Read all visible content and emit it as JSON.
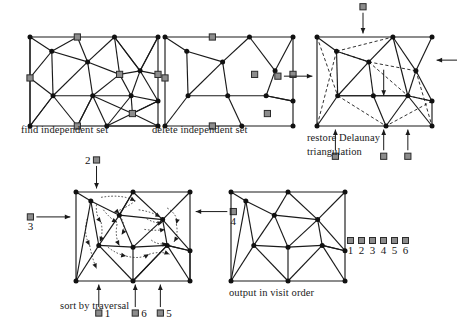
{
  "figure": {
    "background_color": "#ffffff",
    "node_color": "#111111",
    "marked_node_color": "#8c8c8c",
    "marked_node_border": "#2b2b2b",
    "edge_color": "#1a1a1a",
    "dashed_edge_color": "#1a1a1a",
    "arrow_color": "#1a1a1a"
  },
  "panels": [
    {
      "id": "find-independent-set",
      "caption": "find independent set",
      "box": [
        24,
        31,
        128,
        89
      ],
      "nodes": [
        {
          "x": 0.0,
          "y": 0.0,
          "marked": false
        },
        {
          "x": 0.37,
          "y": 0.0,
          "marked": true
        },
        {
          "x": 0.66,
          "y": 0.0,
          "marked": false
        },
        {
          "x": 1.0,
          "y": 0.0,
          "marked": false
        },
        {
          "x": 0.17,
          "y": 0.16,
          "marked": false
        },
        {
          "x": 0.45,
          "y": 0.28,
          "marked": false
        },
        {
          "x": 0.0,
          "y": 0.46,
          "marked": true
        },
        {
          "x": 0.7,
          "y": 0.42,
          "marked": true
        },
        {
          "x": 0.86,
          "y": 0.38,
          "marked": false
        },
        {
          "x": 1.0,
          "y": 0.42,
          "marked": true
        },
        {
          "x": 0.18,
          "y": 0.66,
          "marked": false
        },
        {
          "x": 0.49,
          "y": 0.66,
          "marked": false
        },
        {
          "x": 0.79,
          "y": 0.66,
          "marked": false
        },
        {
          "x": 1.0,
          "y": 0.72,
          "marked": false
        },
        {
          "x": 0.8,
          "y": 0.86,
          "marked": true
        },
        {
          "x": 0.0,
          "y": 1.0,
          "marked": false
        },
        {
          "x": 0.37,
          "y": 1.0,
          "marked": true
        },
        {
          "x": 0.6,
          "y": 1.0,
          "marked": false
        },
        {
          "x": 1.0,
          "y": 1.0,
          "marked": false
        }
      ],
      "edges": [
        [
          0,
          1
        ],
        [
          1,
          2
        ],
        [
          2,
          3
        ],
        [
          0,
          6
        ],
        [
          6,
          15
        ],
        [
          15,
          16
        ],
        [
          16,
          17
        ],
        [
          17,
          18
        ],
        [
          3,
          9
        ],
        [
          9,
          13
        ],
        [
          13,
          18
        ],
        [
          0,
          4
        ],
        [
          1,
          4
        ],
        [
          4,
          5
        ],
        [
          1,
          5
        ],
        [
          2,
          5
        ],
        [
          2,
          7
        ],
        [
          5,
          7
        ],
        [
          4,
          6
        ],
        [
          6,
          10
        ],
        [
          4,
          10
        ],
        [
          5,
          10
        ],
        [
          5,
          11
        ],
        [
          10,
          11
        ],
        [
          11,
          7
        ],
        [
          7,
          8
        ],
        [
          8,
          2
        ],
        [
          2,
          8
        ],
        [
          8,
          3
        ],
        [
          3,
          8
        ],
        [
          8,
          9
        ],
        [
          7,
          12
        ],
        [
          12,
          8
        ],
        [
          8,
          13
        ],
        [
          12,
          13
        ],
        [
          11,
          12
        ],
        [
          10,
          16
        ],
        [
          11,
          16
        ],
        [
          16,
          11
        ],
        [
          11,
          17
        ],
        [
          12,
          17
        ],
        [
          12,
          14
        ],
        [
          14,
          17
        ],
        [
          14,
          13
        ],
        [
          14,
          18
        ],
        [
          17,
          18
        ],
        [
          13,
          14
        ],
        [
          15,
          10
        ],
        [
          0,
          15
        ],
        [
          10,
          15
        ],
        [
          11,
          14
        ]
      ],
      "dashed_edges": [],
      "arrows": []
    },
    {
      "id": "delete-independent-set",
      "caption": "delete independent set",
      "box": [
        159,
        31,
        128,
        89
      ],
      "nodes": [
        {
          "x": 0.0,
          "y": 0.0,
          "marked": false
        },
        {
          "x": 0.37,
          "y": 0.0,
          "marked": true
        },
        {
          "x": 0.66,
          "y": 0.0,
          "marked": false
        },
        {
          "x": 1.0,
          "y": 0.0,
          "marked": false
        },
        {
          "x": 0.17,
          "y": 0.16,
          "marked": false
        },
        {
          "x": 0.45,
          "y": 0.28,
          "marked": false
        },
        {
          "x": 0.0,
          "y": 0.46,
          "marked": true
        },
        {
          "x": 0.7,
          "y": 0.42,
          "marked": true
        },
        {
          "x": 0.86,
          "y": 0.38,
          "marked": false
        },
        {
          "x": 1.0,
          "y": 0.42,
          "marked": true
        },
        {
          "x": 0.18,
          "y": 0.66,
          "marked": false
        },
        {
          "x": 0.49,
          "y": 0.66,
          "marked": false
        },
        {
          "x": 0.79,
          "y": 0.66,
          "marked": false
        },
        {
          "x": 1.0,
          "y": 0.72,
          "marked": false
        },
        {
          "x": 0.8,
          "y": 0.86,
          "marked": true
        },
        {
          "x": 0.0,
          "y": 1.0,
          "marked": false
        },
        {
          "x": 0.37,
          "y": 1.0,
          "marked": true
        },
        {
          "x": 0.6,
          "y": 1.0,
          "marked": false
        },
        {
          "x": 1.0,
          "y": 1.0,
          "marked": false
        }
      ],
      "edges": [
        [
          0,
          1
        ],
        [
          1,
          2
        ],
        [
          2,
          3
        ],
        [
          0,
          6
        ],
        [
          6,
          15
        ],
        [
          15,
          16
        ],
        [
          16,
          17
        ],
        [
          17,
          18
        ],
        [
          3,
          9
        ],
        [
          9,
          13
        ],
        [
          13,
          18
        ],
        [
          0,
          4
        ],
        [
          4,
          5
        ],
        [
          2,
          5
        ],
        [
          4,
          10
        ],
        [
          5,
          10
        ],
        [
          5,
          11
        ],
        [
          10,
          11
        ],
        [
          2,
          8
        ],
        [
          8,
          3
        ],
        [
          8,
          12
        ],
        [
          11,
          12
        ],
        [
          12,
          13
        ],
        [
          10,
          15
        ],
        [
          11,
          17
        ],
        [
          12,
          13
        ]
      ],
      "dashed_edges": [],
      "arrows": []
    },
    {
      "id": "restore-delaunay-triangulation",
      "caption": "restore Delaunay triangulation",
      "box": [
        311,
        31,
        115,
        89
      ],
      "nodes": [
        {
          "x": 0.0,
          "y": 0.0,
          "marked": false
        },
        {
          "x": 0.66,
          "y": 0.0,
          "marked": false
        },
        {
          "x": 1.0,
          "y": 0.0,
          "marked": false
        },
        {
          "x": 0.17,
          "y": 0.16,
          "marked": false
        },
        {
          "x": 0.45,
          "y": 0.28,
          "marked": false
        },
        {
          "x": 0.86,
          "y": 0.38,
          "marked": false
        },
        {
          "x": 0.18,
          "y": 0.66,
          "marked": false
        },
        {
          "x": 0.49,
          "y": 0.66,
          "marked": false
        },
        {
          "x": 0.79,
          "y": 0.66,
          "marked": false
        },
        {
          "x": 1.0,
          "y": 0.72,
          "marked": false
        },
        {
          "x": 0.0,
          "y": 1.0,
          "marked": false
        },
        {
          "x": 0.6,
          "y": 1.0,
          "marked": false
        },
        {
          "x": 1.0,
          "y": 1.0,
          "marked": false
        }
      ],
      "edges": [
        [
          0,
          1
        ],
        [
          1,
          2
        ],
        [
          0,
          10
        ],
        [
          10,
          11
        ],
        [
          11,
          12
        ],
        [
          2,
          5
        ],
        [
          5,
          9
        ],
        [
          9,
          12
        ],
        [
          0,
          3
        ],
        [
          3,
          4
        ],
        [
          1,
          4
        ],
        [
          4,
          7
        ],
        [
          3,
          6
        ],
        [
          6,
          7
        ],
        [
          4,
          6
        ],
        [
          1,
          5
        ],
        [
          5,
          8
        ],
        [
          7,
          8
        ],
        [
          8,
          9
        ],
        [
          6,
          7
        ],
        [
          7,
          8
        ],
        [
          6,
          10
        ],
        [
          7,
          11
        ],
        [
          8,
          11
        ],
        [
          8,
          12
        ],
        [
          1,
          8
        ]
      ],
      "dashed_edges": [
        [
          3,
          1
        ],
        [
          3,
          10
        ],
        [
          0,
          6
        ],
        [
          4,
          5
        ],
        [
          4,
          8
        ],
        [
          6,
          11
        ],
        [
          5,
          12
        ],
        [
          8,
          9
        ],
        [
          3,
          4
        ],
        [
          9,
          11
        ]
      ],
      "arrows": [
        {
          "dir": "up",
          "label": null,
          "sq_x": 0.4,
          "sq_y": -0.34,
          "tip_x": 0.4,
          "tip_y": -0.04
        },
        {
          "dir": "right",
          "label": null,
          "sq_x": 1.34,
          "sq_y": 0.26,
          "tip_x": 1.04,
          "tip_y": 0.26
        },
        {
          "dir": "left",
          "label": null,
          "sq_x": -0.34,
          "sq_y": 0.44,
          "tip_x": -0.04,
          "tip_y": 0.44
        },
        {
          "dir": "down",
          "label": null,
          "sq_x": 0.16,
          "sq_y": 1.34,
          "tip_x": 0.16,
          "tip_y": 1.04
        },
        {
          "dir": "down",
          "label": null,
          "sq_x": 0.58,
          "sq_y": 1.34,
          "tip_x": 0.58,
          "tip_y": 1.04
        },
        {
          "dir": "down",
          "label": null,
          "sq_x": 0.79,
          "sq_y": 1.34,
          "tip_x": 0.79,
          "tip_y": 1.04
        },
        {
          "dir": "down-inner",
          "label": null,
          "sq_x": 0.58,
          "sq_y": 0.3,
          "tip_x": 0.58,
          "tip_y": 0.66
        }
      ]
    },
    {
      "id": "sort-by-traversal",
      "caption": "sort by traversal",
      "box": [
        70,
        186,
        114,
        89
      ],
      "nodes": [
        {
          "x": 0.0,
          "y": 0.0,
          "marked": false
        },
        {
          "x": 0.5,
          "y": 0.0,
          "marked": false
        },
        {
          "x": 1.0,
          "y": 0.0,
          "marked": false
        },
        {
          "x": 0.13,
          "y": 0.1,
          "marked": false
        },
        {
          "x": 0.38,
          "y": 0.26,
          "marked": false
        },
        {
          "x": 0.76,
          "y": 0.31,
          "marked": false
        },
        {
          "x": 0.2,
          "y": 0.6,
          "marked": false
        },
        {
          "x": 0.5,
          "y": 0.62,
          "marked": false
        },
        {
          "x": 0.8,
          "y": 0.6,
          "marked": false
        },
        {
          "x": 1.0,
          "y": 0.66,
          "marked": false
        },
        {
          "x": 0.0,
          "y": 1.0,
          "marked": false
        },
        {
          "x": 0.5,
          "y": 1.0,
          "marked": false
        },
        {
          "x": 1.0,
          "y": 1.0,
          "marked": false
        }
      ],
      "edges": [
        [
          0,
          1
        ],
        [
          1,
          2
        ],
        [
          0,
          10
        ],
        [
          10,
          11
        ],
        [
          11,
          12
        ],
        [
          2,
          9
        ],
        [
          9,
          12
        ],
        [
          0,
          3
        ],
        [
          3,
          4
        ],
        [
          1,
          4
        ],
        [
          4,
          5
        ],
        [
          1,
          5
        ],
        [
          2,
          5
        ],
        [
          3,
          6
        ],
        [
          6,
          4
        ],
        [
          4,
          7
        ],
        [
          7,
          5
        ],
        [
          5,
          8
        ],
        [
          8,
          9
        ],
        [
          6,
          7
        ],
        [
          7,
          8
        ],
        [
          6,
          10
        ],
        [
          7,
          11
        ],
        [
          8,
          11
        ],
        [
          8,
          12
        ],
        [
          9,
          8
        ],
        [
          3,
          10
        ],
        [
          6,
          11
        ],
        [
          5,
          9
        ],
        [
          11,
          8
        ],
        [
          4,
          1
        ],
        [
          12,
          9
        ]
      ],
      "dashed_edges": [],
      "arrows": [
        {
          "dir": "up",
          "label": "2",
          "label_side": "left",
          "sq_x": 0.18,
          "sq_y": -0.36,
          "tip_x": 0.18,
          "tip_y": -0.04
        },
        {
          "dir": "left",
          "label": "3",
          "label_side": "below",
          "sq_x": -0.4,
          "sq_y": 0.28,
          "tip_x": -0.05,
          "tip_y": 0.28
        },
        {
          "dir": "right",
          "label": "4",
          "label_side": "below",
          "sq_x": 1.38,
          "sq_y": 0.22,
          "tip_x": 1.05,
          "tip_y": 0.22
        },
        {
          "dir": "down",
          "label": "1",
          "label_side": "right",
          "sq_x": 0.2,
          "sq_y": 1.36,
          "tip_x": 0.2,
          "tip_y": 1.04
        },
        {
          "dir": "down",
          "label": "6",
          "label_side": "right",
          "sq_x": 0.52,
          "sq_y": 1.36,
          "tip_x": 0.52,
          "tip_y": 1.04
        },
        {
          "dir": "down",
          "label": "5",
          "label_side": "right",
          "sq_x": 0.74,
          "sq_y": 1.36,
          "tip_x": 0.74,
          "tip_y": 1.04
        }
      ],
      "traversal_arrows": 18
    },
    {
      "id": "output-in-visit-order",
      "caption": "output in visit order",
      "box": [
        225,
        186,
        114,
        89
      ],
      "nodes": [
        {
          "x": 0.0,
          "y": 0.0,
          "marked": false
        },
        {
          "x": 0.5,
          "y": 0.0,
          "marked": false
        },
        {
          "x": 1.0,
          "y": 0.0,
          "marked": false
        },
        {
          "x": 0.13,
          "y": 0.1,
          "marked": false
        },
        {
          "x": 0.38,
          "y": 0.26,
          "marked": false
        },
        {
          "x": 0.76,
          "y": 0.31,
          "marked": false
        },
        {
          "x": 0.2,
          "y": 0.6,
          "marked": false
        },
        {
          "x": 0.5,
          "y": 0.62,
          "marked": false
        },
        {
          "x": 0.8,
          "y": 0.6,
          "marked": false
        },
        {
          "x": 1.0,
          "y": 0.66,
          "marked": false
        },
        {
          "x": 0.0,
          "y": 1.0,
          "marked": false
        },
        {
          "x": 0.5,
          "y": 1.0,
          "marked": false
        },
        {
          "x": 1.0,
          "y": 1.0,
          "marked": false
        }
      ],
      "edges": [
        [
          0,
          1
        ],
        [
          1,
          2
        ],
        [
          0,
          10
        ],
        [
          10,
          11
        ],
        [
          11,
          12
        ],
        [
          2,
          9
        ],
        [
          9,
          12
        ],
        [
          0,
          3
        ],
        [
          3,
          4
        ],
        [
          1,
          4
        ],
        [
          4,
          5
        ],
        [
          1,
          5
        ],
        [
          2,
          5
        ],
        [
          3,
          6
        ],
        [
          6,
          4
        ],
        [
          4,
          7
        ],
        [
          7,
          5
        ],
        [
          5,
          8
        ],
        [
          8,
          9
        ],
        [
          6,
          7
        ],
        [
          7,
          8
        ],
        [
          6,
          10
        ],
        [
          7,
          11
        ],
        [
          8,
          11
        ],
        [
          8,
          12
        ],
        [
          9,
          8
        ],
        [
          3,
          10
        ],
        [
          6,
          11
        ],
        [
          5,
          9
        ]
      ],
      "dashed_edges": [],
      "arrows": []
    }
  ],
  "captions": {
    "find_independent_set": "find independent set",
    "delete_independent_set": "delete independent set",
    "restore_delaunay_line1": "restore Delaunay",
    "restore_delaunay_line2": "triangulation",
    "sort_by_traversal": "sort by traversal",
    "output_in_visit_order": "output in visit order"
  },
  "legend": {
    "name": "visit-order-legend",
    "items": [
      {
        "marker": "square",
        "label": "1"
      },
      {
        "marker": "square",
        "label": "2"
      },
      {
        "marker": "square",
        "label": "3"
      },
      {
        "marker": "square",
        "label": "4"
      },
      {
        "marker": "square",
        "label": "5"
      },
      {
        "marker": "square",
        "label": "6"
      }
    ]
  }
}
